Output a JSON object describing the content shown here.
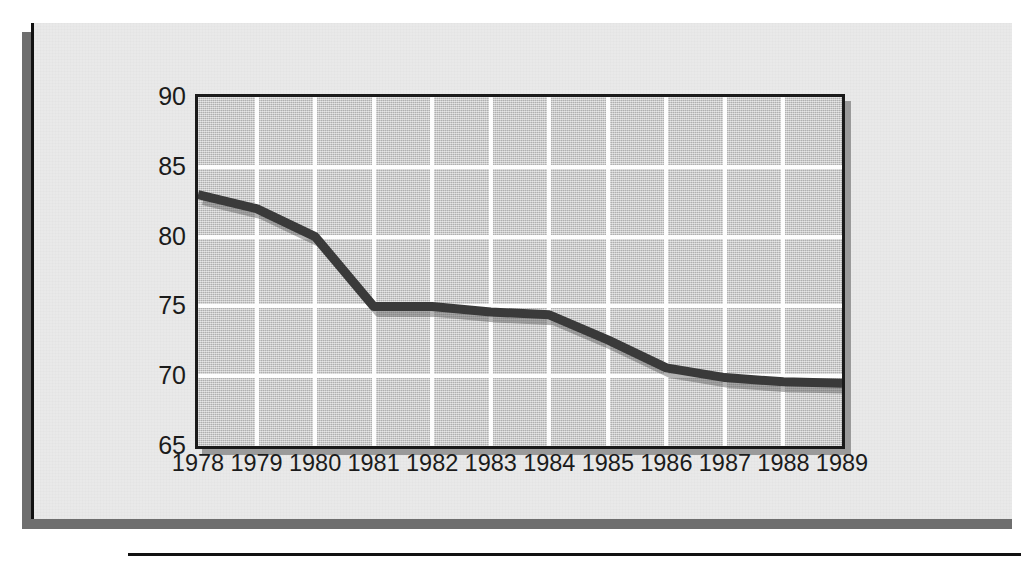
{
  "chart_data": {
    "type": "line",
    "title": "",
    "subtitle": "",
    "xlabel": "",
    "ylabel": "",
    "categories": [
      "1978",
      "1979",
      "1980",
      "1981",
      "1982",
      "1983",
      "1984",
      "1985",
      "1986",
      "1987",
      "1988",
      "1989"
    ],
    "x": [
      1978,
      1979,
      1980,
      1981,
      1982,
      1983,
      1984,
      1985,
      1986,
      1987,
      1988,
      1989
    ],
    "values": [
      83.0,
      82.0,
      80.0,
      75.0,
      75.0,
      74.6,
      74.4,
      72.6,
      70.6,
      69.9,
      69.6,
      69.5
    ],
    "series": [
      {
        "name": "",
        "values": [
          83.0,
          82.0,
          80.0,
          75.0,
          75.0,
          74.6,
          74.4,
          72.6,
          70.6,
          69.9,
          69.6,
          69.5
        ]
      }
    ],
    "xlim": [
      1978,
      1989
    ],
    "ylim": [
      65,
      90
    ],
    "yticks": [
      65,
      70,
      75,
      80,
      85,
      90
    ],
    "ytick_labels": [
      "65",
      "70",
      "75",
      "80",
      "85",
      "90"
    ],
    "xticks": [
      1978,
      1979,
      1980,
      1981,
      1982,
      1983,
      1984,
      1985,
      1986,
      1987,
      1988,
      1989
    ],
    "xtick_labels": [
      "1978",
      "1979",
      "1980",
      "1981",
      "1982",
      "1983",
      "1984",
      "1985",
      "1986",
      "1987",
      "1988",
      "1989"
    ],
    "grid": true,
    "grid_color": "#fdfdfd",
    "legend": false,
    "legend_position": "none",
    "line_color": "#3a3a3a",
    "line_width": 9,
    "plot_background": "#c4c4c4",
    "frame_color": "#1a1a1a",
    "annotations": []
  },
  "figure": {
    "card_background": "#e9e9e9",
    "page_background": "#ffffff",
    "shadow_color": "#6e6e6e",
    "rule_color": "#111111"
  }
}
